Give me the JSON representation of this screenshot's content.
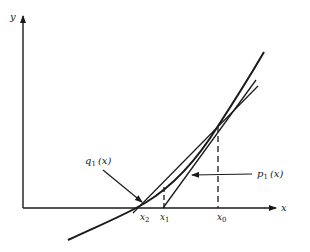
{
  "diagram": {
    "title": "",
    "axes": {
      "x_label": "x",
      "y_label": "y"
    },
    "points": [
      {
        "name": "x0",
        "base": "x",
        "sub": "0"
      },
      {
        "name": "x1",
        "base": "x",
        "sub": "1"
      },
      {
        "name": "x2",
        "base": "x",
        "sub": "2"
      }
    ],
    "annotations": {
      "p1": {
        "base": "p",
        "sub": "1",
        "arg": "(x)"
      },
      "q1": {
        "base": "q",
        "sub": "1",
        "arg": "(x)"
      }
    },
    "colors": {
      "stroke": "#1a1a1a",
      "background": "#ffffff"
    }
  }
}
